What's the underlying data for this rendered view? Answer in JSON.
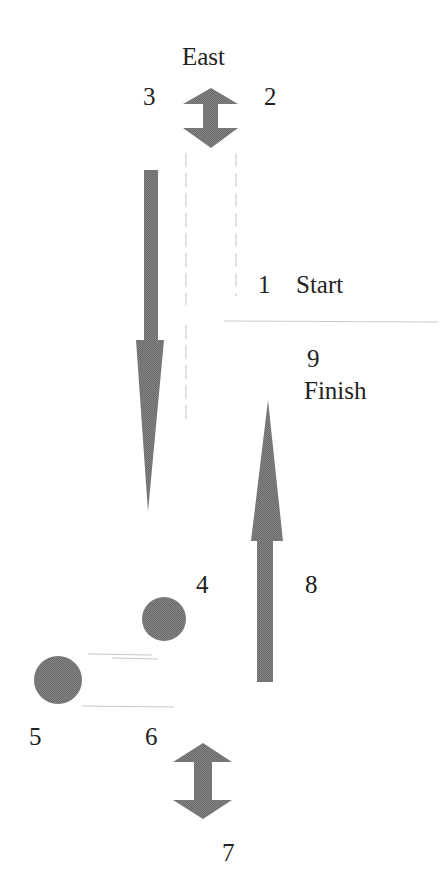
{
  "diagram": {
    "type": "route-diagram",
    "fill_color": "#7a7a7a",
    "line_color": "#c8c8c8",
    "labels": {
      "east": "East",
      "p1": "1",
      "start": "Start",
      "p2": "2",
      "p3": "3",
      "p4": "4",
      "p5": "5",
      "p6": "6",
      "p7": "7",
      "p8": "8",
      "p9": "9",
      "finish": "Finish"
    },
    "elements": [
      {
        "id": "double-arrow-top",
        "shape": "double-arrow",
        "direction": "vertical"
      },
      {
        "id": "arrow-down",
        "shape": "arrow",
        "direction": "down"
      },
      {
        "id": "arrow-up",
        "shape": "arrow",
        "direction": "up"
      },
      {
        "id": "circle-4",
        "shape": "circle"
      },
      {
        "id": "circle-5",
        "shape": "circle"
      },
      {
        "id": "double-arrow-bottom",
        "shape": "double-arrow",
        "direction": "vertical"
      }
    ]
  }
}
